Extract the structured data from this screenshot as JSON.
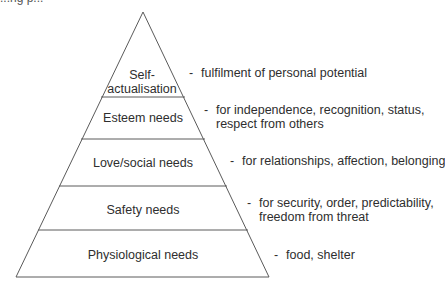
{
  "caption_fragment": "...ng p...",
  "colors": {
    "line": "#5a5a5a",
    "text": "#2e2e2e",
    "background": "#ffffff"
  },
  "pyramid": {
    "apex": [
      143,
      12
    ],
    "base_left": [
      16,
      277
    ],
    "base_right": [
      269,
      277
    ],
    "dividers_y": [
      97,
      139,
      186,
      230
    ]
  },
  "levels": [
    {
      "name": "Self-\nactualisation",
      "line1": "Self-",
      "line2": "actualisation",
      "description": "fulfilment of personal potential"
    },
    {
      "name": "Esteem needs",
      "description_line1": "for independence, recognition, status,",
      "description_line2": "respect from others"
    },
    {
      "name": "Love/social needs",
      "description": "for relationships, affection, belonging"
    },
    {
      "name": "Safety needs",
      "description_line1": "for security, order, predictability,",
      "description_line2": "freedom from threat"
    },
    {
      "name": "Physiological needs",
      "description": "food, shelter"
    }
  ],
  "dash": "-"
}
